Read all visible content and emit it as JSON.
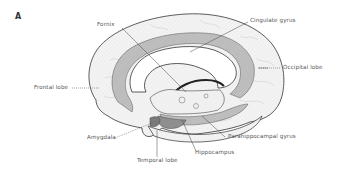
{
  "figure": {
    "panel_label": "A",
    "labels": {
      "fornix": "Fornix",
      "cingulate_gyrus": "Cingulate gyrus",
      "occipital_lobe": "Occipital lobe",
      "frontal_lobe": "Frontal lobe",
      "amygdala": "Amygdala",
      "parahippocampal_gyrus": "Parahippocampal gyrus",
      "hippocampus": "Hippocampus",
      "temporal_lobe": "Temporal lobe"
    },
    "colors": {
      "outline": "#333333",
      "limbic_shade": "#b8b8b8",
      "cortex_fill": "#f4f4f4",
      "leader_line": "#444444",
      "label_text": "#555555"
    }
  }
}
